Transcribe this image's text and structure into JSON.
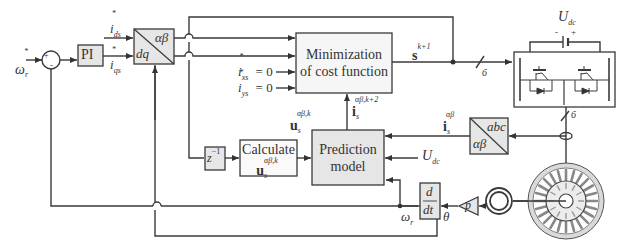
{
  "diagram": {
    "type": "block-diagram",
    "colors": {
      "line": "#3a3a3a",
      "block_fill_gray": "#e6e6e6",
      "block_fill_white": "#ffffff",
      "background": "#ffffff"
    },
    "inputs": {
      "speed_ref": "ω",
      "speed_ref_sub": "r",
      "speed_ref_sup": "*"
    },
    "sum_junction": {
      "plus": "+",
      "minus": "-"
    },
    "blocks": {
      "pi": {
        "label": "PI"
      },
      "dq_to_ab": {
        "top": "αβ",
        "bottom": "dq"
      },
      "minimization": {
        "line1": "Minimization",
        "line2": "of cost function"
      },
      "prediction": {
        "line1": "Prediction",
        "line2": "model"
      },
      "calculate": {
        "line1": "Calculate",
        "line2_main": "u",
        "line2_sub": "s",
        "line2_sup": "αβ,k"
      },
      "delay": {
        "main": "z",
        "sup": "−1"
      },
      "abc_to_ab": {
        "top": "abc",
        "bottom": "αβ"
      },
      "derivative": {
        "num": "d",
        "den": "dt"
      },
      "pole_pairs": {
        "label": "p"
      },
      "inverter": {
        "label": "Inverter",
        "dc_label": "U",
        "dc_sub": "dc",
        "minus": "-",
        "plus": "+"
      },
      "motor": {
        "label": "PMSM"
      },
      "encoder": {
        "label": "encoder"
      }
    },
    "signals": {
      "ids_ref": {
        "main": "i",
        "sub": "ds",
        "sup": "*"
      },
      "iqs_ref": {
        "main": "i",
        "sub": "qs",
        "sup": "*"
      },
      "ixs_ref": {
        "main": "i",
        "sub": "xs",
        "sup": "*",
        "eq": "= 0"
      },
      "iys_ref": {
        "main": "i",
        "sub": "ys",
        "sup": "*",
        "eq": "= 0"
      },
      "switch_state": {
        "main": "s",
        "sup": "k+1"
      },
      "bus_width_top": "6",
      "bus_width_right": "6",
      "predicted_current": {
        "main": "i",
        "sub": "s",
        "sup": "αβ,k+2"
      },
      "voltage_vector": {
        "main": "u",
        "sub": "s",
        "sup": "αβ,k"
      },
      "measured_current": {
        "main": "i",
        "sub": "s",
        "sup": "αβ"
      },
      "dc_voltage": {
        "main": "U",
        "sub": "dc"
      },
      "rotor_speed": {
        "main": "ω",
        "sub": "r"
      },
      "rotor_angle": {
        "main": "θ"
      }
    }
  }
}
